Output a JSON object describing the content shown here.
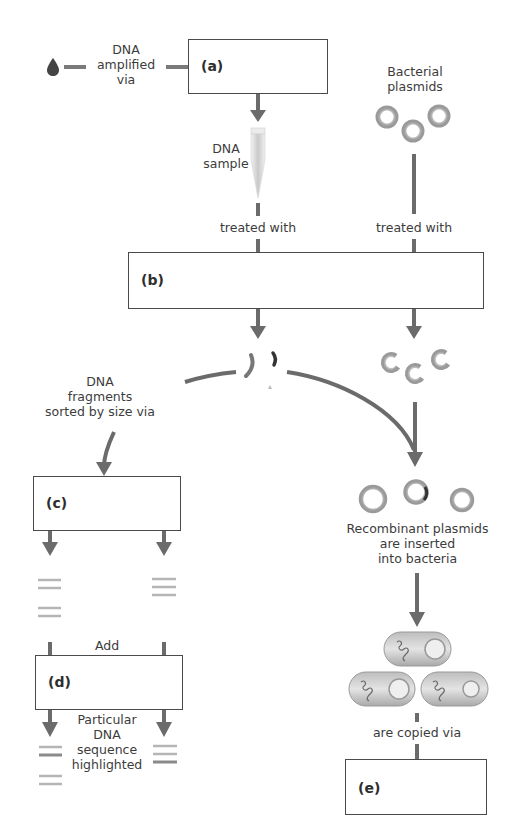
{
  "diagram": {
    "type": "recombinant DNA workflow concept map",
    "boxes": [
      {
        "id": "a",
        "label": "(a)"
      },
      {
        "id": "b",
        "label": "(b)"
      },
      {
        "id": "c",
        "label": "(c)"
      },
      {
        "id": "d",
        "label": "(d)"
      },
      {
        "id": "e",
        "label": "(e)"
      }
    ],
    "labels": {
      "dna_amplified": [
        "DNA",
        "amplified",
        "via"
      ],
      "bacterial_plasmids": [
        "Bacterial",
        "plasmids"
      ],
      "dna_sample": [
        "DNA",
        "sample"
      ],
      "treated_with_left": "treated with",
      "treated_with_right": "treated with",
      "dna_fragments": [
        "DNA",
        "fragments",
        "sorted by size via"
      ],
      "recombinant": [
        "Recombinant plasmids",
        "are inserted",
        "into bacteria"
      ],
      "add": "Add",
      "particular": [
        "Particular",
        "DNA",
        "sequence",
        "highlighted"
      ],
      "copied": "are copied via"
    },
    "icons": {
      "drop": "blood-drop-icon",
      "tube": "test-tube-icon",
      "plasmid": "plasmid-ring-icon",
      "fragment": "dna-fragment-icon",
      "bacterium": "bacterium-icon",
      "gel_band": "gel-band-icon"
    },
    "colors": {
      "arrow": "#6b6b6b",
      "box_border": "#4a4a4a",
      "plasmid": "#a8a8a8",
      "text": "#3c3c3c"
    }
  }
}
